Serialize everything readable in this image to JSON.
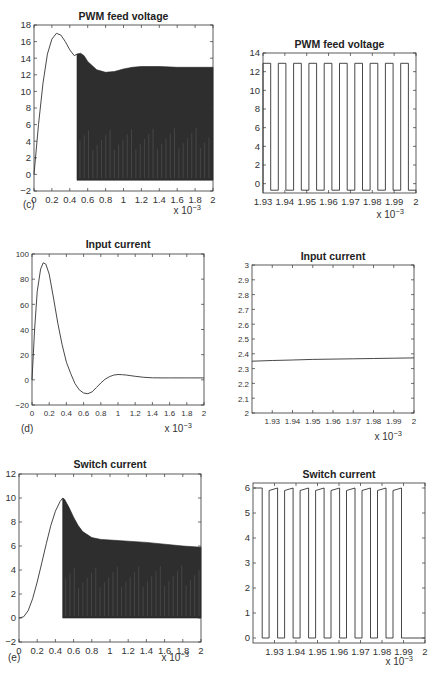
{
  "figure": {
    "panel_labels": [
      "(c)",
      "(d)",
      "(e)"
    ],
    "x_multiplier": "x 10",
    "x_multiplier_exp": "-3"
  },
  "chart_data": [
    {
      "id": "c_left",
      "type": "line",
      "title": "PWM feed voltage",
      "panel_label": "(c)",
      "xlabel": "",
      "ylabel": "",
      "xlim": [
        0,
        2
      ],
      "ylim": [
        -2,
        18
      ],
      "x_multiplier": "x 10^-3",
      "xticks": [
        "0",
        "0.2",
        "0.4",
        "0.6",
        "0.8",
        "1",
        "1.2",
        "1.4",
        "1.6",
        "1.8",
        "2"
      ],
      "yticks": [
        "-2",
        "0",
        "2",
        "4",
        "6",
        "8",
        "10",
        "12",
        "14",
        "16",
        "18"
      ],
      "series": [
        {
          "name": "envelope-top",
          "x": [
            0,
            0.05,
            0.1,
            0.15,
            0.2,
            0.25,
            0.3,
            0.35,
            0.4,
            0.45,
            0.48,
            0.52,
            0.56,
            0.6,
            0.7,
            0.8,
            0.9,
            1.0,
            1.1,
            1.2,
            1.4,
            1.6,
            1.8,
            2.0
          ],
          "y": [
            0,
            6,
            11,
            14.5,
            16.3,
            17,
            16.8,
            16,
            15,
            14.3,
            14.5,
            14.6,
            14.3,
            13.6,
            12.6,
            12.3,
            12.4,
            12.7,
            12.9,
            13,
            13,
            12.9,
            12.9,
            12.9
          ]
        },
        {
          "name": "envelope-bottom",
          "x": [
            0.48,
            2.0
          ],
          "y": [
            -0.7,
            -0.7
          ]
        }
      ],
      "annotations": [
        "PWM switching begins at ~0.47e-3 s (dense filled region)"
      ],
      "grid": false
    },
    {
      "id": "c_right",
      "type": "line",
      "title": "PWM feed voltage",
      "xlim": [
        1.93,
        2.0
      ],
      "ylim": [
        -1,
        14
      ],
      "x_multiplier": "x 10^-3",
      "xticks": [
        "1.93",
        "1.94",
        "1.95",
        "1.96",
        "1.97",
        "1.98",
        "1.99",
        "2"
      ],
      "yticks": [
        "0",
        "2",
        "4",
        "6",
        "8",
        "10",
        "12",
        "14"
      ],
      "series": [
        {
          "name": "square-wave",
          "high": 12.9,
          "low": -0.7,
          "periods": 10,
          "duty": 0.5
        }
      ],
      "grid": false
    },
    {
      "id": "d_left",
      "type": "line",
      "title": "Input current",
      "panel_label": "(d)",
      "xlim": [
        0,
        2
      ],
      "ylim": [
        -20,
        100
      ],
      "x_multiplier": "x 10^-3",
      "xticks": [
        "0",
        "0.2",
        "0.4",
        "0.6",
        "0.8",
        "1",
        "1.2",
        "1.4",
        "1.6",
        "1.8",
        "2"
      ],
      "yticks": [
        "-20",
        "0",
        "20",
        "40",
        "60",
        "80",
        "100"
      ],
      "series": [
        {
          "name": "input-current",
          "x": [
            0,
            0.03,
            0.06,
            0.1,
            0.13,
            0.16,
            0.2,
            0.25,
            0.3,
            0.35,
            0.4,
            0.45,
            0.5,
            0.55,
            0.6,
            0.65,
            0.7,
            0.75,
            0.8,
            0.85,
            0.9,
            0.95,
            1.0,
            1.05,
            1.1,
            1.15,
            1.2,
            1.3,
            1.4,
            1.5,
            1.6,
            1.8,
            2.0
          ],
          "y": [
            0,
            40,
            70,
            88,
            93,
            92,
            84,
            65,
            45,
            28,
            14,
            5,
            -3,
            -8,
            -10.5,
            -11,
            -9.5,
            -6,
            -2.5,
            0.5,
            2.5,
            3.8,
            4.2,
            4.1,
            3.8,
            3.3,
            2.8,
            2.0,
            1.6,
            1.5,
            1.5,
            1.5,
            1.5
          ]
        }
      ],
      "grid": false
    },
    {
      "id": "d_right",
      "type": "line",
      "title": "Input current",
      "xlim": [
        1.92,
        2.0
      ],
      "ylim": [
        2,
        3
      ],
      "x_multiplier": "x 10^-3",
      "xticks": [
        "1.93",
        "1.94",
        "1.95",
        "1.96",
        "1.97",
        "1.98",
        "1.99",
        "2"
      ],
      "yticks": [
        "2",
        "2.1",
        "2.2",
        "2.3",
        "2.4",
        "2.5",
        "2.6",
        "2.7",
        "2.8",
        "2.9",
        "3"
      ],
      "series": [
        {
          "name": "input-current",
          "x": [
            1.92,
            1.93,
            1.94,
            1.95,
            1.96,
            1.97,
            1.98,
            1.99,
            2.0
          ],
          "y": [
            2.35,
            2.355,
            2.358,
            2.362,
            2.364,
            2.366,
            2.368,
            2.37,
            2.372
          ]
        }
      ],
      "grid": false
    },
    {
      "id": "e_left",
      "type": "line",
      "title": "Switch current",
      "panel_label": "(e)",
      "xlim": [
        0,
        2
      ],
      "ylim": [
        -2,
        12
      ],
      "x_multiplier": "x 10^-3",
      "xticks": [
        "0",
        "0.2",
        "0.4",
        "0.6",
        "0.8",
        "1",
        "1.2",
        "1.4",
        "1.6",
        "1.8",
        "2"
      ],
      "yticks": [
        "-2",
        "0",
        "2",
        "4",
        "6",
        "8",
        "10",
        "12"
      ],
      "series": [
        {
          "name": "envelope-top",
          "x": [
            0,
            0.05,
            0.1,
            0.15,
            0.2,
            0.25,
            0.3,
            0.35,
            0.4,
            0.45,
            0.48,
            0.5,
            0.55,
            0.6,
            0.65,
            0.7,
            0.8,
            0.9,
            1.0,
            1.2,
            1.4,
            1.6,
            1.8,
            2.0
          ],
          "y": [
            0,
            0.1,
            0.6,
            1.6,
            3.0,
            4.6,
            6.2,
            7.7,
            8.9,
            9.7,
            10,
            9.9,
            9.2,
            8.4,
            7.7,
            7.2,
            6.7,
            6.55,
            6.5,
            6.4,
            6.3,
            6.15,
            6.0,
            5.9
          ]
        },
        {
          "name": "envelope-bottom",
          "x": [
            0.48,
            2.0
          ],
          "y": [
            0,
            0
          ]
        }
      ],
      "grid": false
    },
    {
      "id": "e_right",
      "type": "line",
      "title": "Switch current",
      "xlim": [
        1.92,
        2.0
      ],
      "ylim": [
        -0.2,
        6.2
      ],
      "x_multiplier": "x 10^-3",
      "xticks": [
        "1.93",
        "1.94",
        "1.95",
        "1.96",
        "1.97",
        "1.98",
        "1.99",
        "2"
      ],
      "yticks": [
        "0",
        "1",
        "2",
        "3",
        "4",
        "5",
        "6"
      ],
      "series": [
        {
          "name": "switch-current",
          "high": 6.0,
          "low": 0,
          "periods": 10,
          "duty": 0.55,
          "high_slope": "slight ramp from ~5.9 to 6.0"
        }
      ],
      "grid": false
    }
  ]
}
